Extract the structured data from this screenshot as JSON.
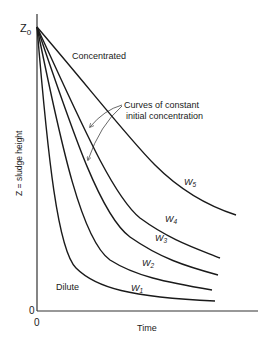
{
  "diagram": {
    "y_axis_label": "Z = sludge height",
    "x_axis_label": "Time",
    "y_top_label": "Z",
    "y_top_subscript": "0",
    "y_origin_label": "0",
    "x_origin_label": "0",
    "region_labels": {
      "concentrated": "Concentrated",
      "dilute": "Dilute"
    },
    "annotation": {
      "line1": "Curves of constant",
      "line2": "initial concentration"
    },
    "curves": [
      {
        "id": "W1",
        "label": "W",
        "subscript": "1",
        "order": "most dilute"
      },
      {
        "id": "W2",
        "label": "W",
        "subscript": "2"
      },
      {
        "id": "W3",
        "label": "W",
        "subscript": "3"
      },
      {
        "id": "W4",
        "label": "W",
        "subscript": "4"
      },
      {
        "id": "W5",
        "label": "W",
        "subscript": "5",
        "order": "most concentrated"
      }
    ]
  }
}
